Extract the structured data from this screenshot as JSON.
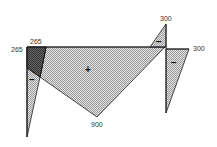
{
  "diagram": {
    "type": "moment-diagram",
    "labels": {
      "left_top": "265",
      "left_side": "265",
      "bottom_peak": "900",
      "top_right_peak": "300",
      "right_end": "300"
    },
    "signs": {
      "main_region": "+",
      "left_region": "−",
      "top_triangle": "−",
      "right_triangle": "−"
    },
    "colors": {
      "line": "#222222",
      "hatch_light": "#c8c8c8",
      "hatch_dark": "#555555",
      "background": "#ffffff"
    }
  }
}
